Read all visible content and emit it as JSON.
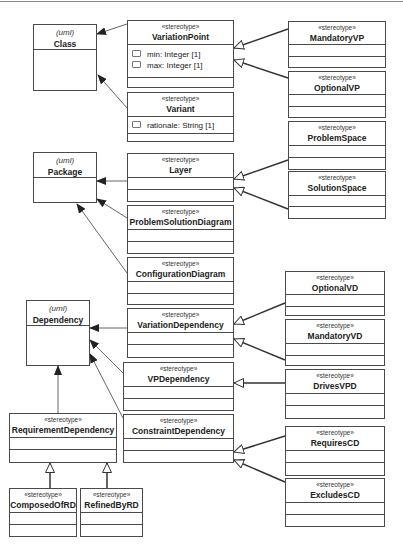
{
  "diagram": {
    "type": "UML profile class diagram",
    "stereotype_label": "«stereotype»",
    "uml_label": "(uml)",
    "metaclasses": [
      {
        "id": "class",
        "keyword": "(uml)",
        "name": "Class"
      },
      {
        "id": "package",
        "keyword": "(uml)",
        "name": "Package"
      },
      {
        "id": "dependency",
        "keyword": "(uml)",
        "name": "Dependency"
      }
    ],
    "stereotypes": [
      {
        "id": "variationpoint",
        "keyword": "«stereotype»",
        "name": "VariationPoint",
        "attributes": [
          "min: Integer [1]",
          "max: Integer [1]"
        ]
      },
      {
        "id": "variant",
        "keyword": "«stereotype»",
        "name": "Variant",
        "attributes": [
          "rationale: String [1]"
        ]
      },
      {
        "id": "mandatoryvp",
        "keyword": "«stereotype»",
        "name": "MandatoryVP"
      },
      {
        "id": "optionalvp",
        "keyword": "«stereotype»",
        "name": "OptionalVP"
      },
      {
        "id": "problemspace",
        "keyword": "«stereotype»",
        "name": "ProblemSpace"
      },
      {
        "id": "solutionspace",
        "keyword": "«stereotype»",
        "name": "SolutionSpace"
      },
      {
        "id": "layer",
        "keyword": "«stereotype»",
        "name": "Layer"
      },
      {
        "id": "problemsolutiondiagram",
        "keyword": "«stereotype»",
        "name": "ProblemSolutionDiagram"
      },
      {
        "id": "configurationdiagram",
        "keyword": "«stereotype»",
        "name": "ConfigurationDiagram"
      },
      {
        "id": "variationdependency",
        "keyword": "«stereotype»",
        "name": "VariationDependency"
      },
      {
        "id": "optionalvd",
        "keyword": "«stereotype»",
        "name": "OptionalVD"
      },
      {
        "id": "mandatoryvd",
        "keyword": "«stereotype»",
        "name": "MandatoryVD"
      },
      {
        "id": "vpdependency",
        "keyword": "«stereotype»",
        "name": "VPDependency"
      },
      {
        "id": "drivesvpd",
        "keyword": "«stereotype»",
        "name": "DrivesVPD"
      },
      {
        "id": "constraintdependency",
        "keyword": "«stereotype»",
        "name": "ConstraintDependency"
      },
      {
        "id": "requirescd",
        "keyword": "«stereotype»",
        "name": "RequiresCD"
      },
      {
        "id": "excludescd",
        "keyword": "«stereotype»",
        "name": "ExcludesCD"
      },
      {
        "id": "requirementdependency",
        "keyword": "«stereotype»",
        "name": "RequirementDependency"
      },
      {
        "id": "composedofrd",
        "keyword": "«stereotype»",
        "name": "ComposedOfRD"
      },
      {
        "id": "refinedbyrd",
        "keyword": "«stereotype»",
        "name": "RefinedByRD"
      }
    ],
    "extensions": [
      [
        "VariationPoint",
        "Class"
      ],
      [
        "Variant",
        "Class"
      ],
      [
        "Layer",
        "Package"
      ],
      [
        "ProblemSolutionDiagram",
        "Package"
      ],
      [
        "ConfigurationDiagram",
        "Package"
      ],
      [
        "VariationDependency",
        "Dependency"
      ],
      [
        "VPDependency",
        "Dependency"
      ],
      [
        "ConstraintDependency",
        "Dependency"
      ]
    ],
    "generalizations": [
      [
        "MandatoryVP",
        "VariationPoint"
      ],
      [
        "OptionalVP",
        "VariationPoint"
      ],
      [
        "ProblemSpace",
        "Layer"
      ],
      [
        "SolutionSpace",
        "Layer"
      ],
      [
        "OptionalVD",
        "VariationDependency"
      ],
      [
        "MandatoryVD",
        "VariationDependency"
      ],
      [
        "DrivesVPD",
        "VPDependency"
      ],
      [
        "RequiresCD",
        "ConstraintDependency"
      ],
      [
        "ExcludesCD",
        "ConstraintDependency"
      ],
      [
        "RequirementDependency",
        "Dependency"
      ],
      [
        "ComposedOfRD",
        "RequirementDependency"
      ],
      [
        "RefinedByRD",
        "RequirementDependency"
      ]
    ],
    "colors": {
      "line": "#4a4a4a",
      "fill": "#ffffff",
      "arrow": "#222222"
    }
  }
}
